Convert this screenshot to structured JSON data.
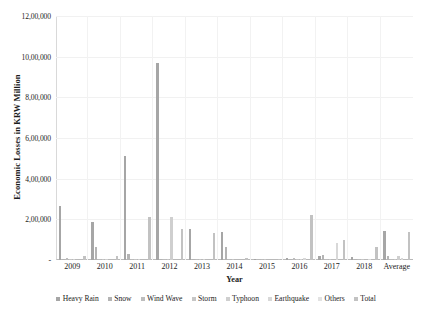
{
  "chart_data": {
    "type": "bar",
    "title": "",
    "xlabel": "Year",
    "ylabel": "Economic Losses in KRW Million",
    "ylim": [
      0,
      1200000
    ],
    "ytick_labels": [
      "12,00,000",
      "10,00,000",
      "8,00,000",
      "6,00,000",
      "4,00,000",
      "2,00,000",
      "-"
    ],
    "ytick_values": [
      1200000,
      1000000,
      800000,
      600000,
      400000,
      200000,
      0
    ],
    "grid": true,
    "legend_position": "bottom",
    "categories": [
      "2009",
      "2010",
      "2011",
      "2012",
      "2013",
      "2014",
      "2015",
      "2016",
      "2017",
      "2018",
      "Average"
    ],
    "series": [
      {
        "name": "Heavy Rain",
        "color": "#a6a6a6",
        "values": [
          265000,
          185000,
          512000,
          968000,
          152000,
          137000,
          3000,
          9000,
          22000,
          16000,
          141000
        ]
      },
      {
        "name": "Snow",
        "color": "#b4b4b4",
        "values": [
          2000,
          62000,
          31000,
          4000,
          3000,
          66000,
          0,
          1000,
          24000,
          2000,
          18000
        ]
      },
      {
        "name": "Wind Wave",
        "color": "#bdbdbd",
        "values": [
          9000,
          6000,
          4000,
          6000,
          5000,
          5000,
          2000,
          8000,
          2000,
          2000,
          4000
        ]
      },
      {
        "name": "Storm",
        "color": "#c6c6c6",
        "values": [
          6000,
          4000,
          2000,
          3000,
          2000,
          2000,
          1000,
          3000,
          1000,
          1000,
          2000
        ]
      },
      {
        "name": "Typhoon",
        "color": "#cfcfcf",
        "values": [
          1000,
          4000,
          1000,
          212000,
          1000,
          0,
          0,
          2000,
          0,
          0,
          22000
        ]
      },
      {
        "name": "Earthquake",
        "color": "#d8d8d8",
        "values": [
          0,
          0,
          0,
          0,
          0,
          0,
          0,
          11000,
          85000,
          1000,
          9000
        ]
      },
      {
        "name": "Others",
        "color": "#e2e2e2",
        "values": [
          0,
          0,
          0,
          0,
          0,
          0,
          0,
          0,
          0,
          0,
          0
        ]
      },
      {
        "name": "Total",
        "color": "#c2c2c2",
        "values": [
          22000,
          18000,
          212000,
          151000,
          135000,
          8000,
          6000,
          220000,
          97000,
          66000,
          139000
        ]
      }
    ]
  },
  "legend": {
    "items": [
      {
        "label": "Heavy Rain"
      },
      {
        "label": "Snow"
      },
      {
        "label": "Wind Wave"
      },
      {
        "label": "Storm"
      },
      {
        "label": "Typhoon"
      },
      {
        "label": "Earthquake"
      },
      {
        "label": "Others"
      },
      {
        "label": "Total"
      }
    ]
  }
}
